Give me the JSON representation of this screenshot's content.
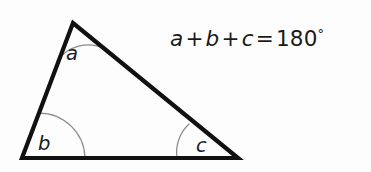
{
  "figure": {
    "background_color": "#fdfdfd",
    "width": 371,
    "height": 172,
    "stroke_color": "#111111",
    "arc_color": "#8c8c8c",
    "text_color": "#1a1a1a"
  },
  "triangle": {
    "vertices": {
      "apex": {
        "label": "a",
        "x": 73,
        "y": 23
      },
      "bottom_left": {
        "label": "b",
        "x": 22,
        "y": 158
      },
      "bottom_right": {
        "label": "c",
        "x": 238,
        "y": 158
      }
    },
    "path": "M 73 23 L 22 158 L 238 158 Z"
  },
  "angle_labels": {
    "a": "a",
    "b": "b",
    "c": "c"
  },
  "angle_label_positions": {
    "a": {
      "x": 66,
      "y": 60
    },
    "b": {
      "x": 38,
      "y": 150
    },
    "c": {
      "x": 196,
      "y": 152
    }
  },
  "angle_arcs": {
    "a": "M 57 61 A 38 38 0 0 1 105 49",
    "b": "M 39 113 A 46 46 0 0 1 85 158",
    "c": "M 189 124 A 39 39 0 0 0 177 158"
  },
  "equation": {
    "full": "a + b + c = 180°",
    "term_a": "a",
    "plus_1": "+",
    "term_b": "b",
    "plus_2": "+",
    "term_c": "c",
    "equals": "=",
    "value": "180",
    "degree_symbol": "°"
  }
}
